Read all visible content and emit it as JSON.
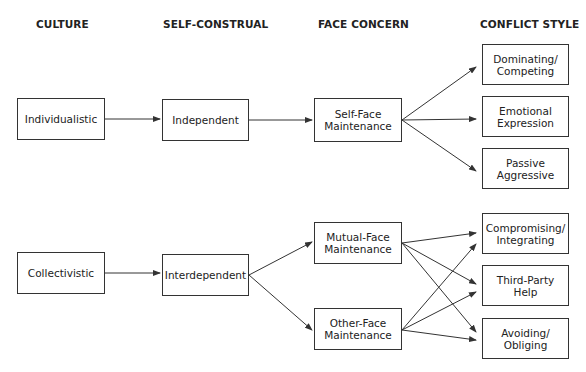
{
  "headers": {
    "culture": "CULTURE",
    "self_construal": "SELF-CONSTRUAL",
    "face_concern": "FACE CONCERN",
    "conflict_style": "CONFLICT STYLE"
  },
  "culture": {
    "individualistic": "Individualistic",
    "collectivistic": "Collectivistic"
  },
  "self_construal": {
    "independent": "Independent",
    "interdependent": "Interdependent"
  },
  "face_concern": {
    "self_face": [
      "Self-Face",
      "Maintenance"
    ],
    "mutual_face": [
      "Mutual-Face",
      "Maintenance"
    ],
    "other_face": [
      "Other-Face",
      "Maintenance"
    ]
  },
  "conflict_style": {
    "dominating": [
      "Dominating/",
      "Competing"
    ],
    "emotional": [
      "Emotional",
      "Expression"
    ],
    "passive": [
      "Passive",
      "Aggressive"
    ],
    "compromising": [
      "Compromising/",
      "Integrating"
    ],
    "third_party": [
      "Third-Party",
      "Help"
    ],
    "avoiding": [
      "Avoiding/",
      "Obliging"
    ]
  },
  "connections": [
    [
      "Individualistic",
      "Independent"
    ],
    [
      "Independent",
      "Self-Face Maintenance"
    ],
    [
      "Self-Face Maintenance",
      "Dominating/Competing"
    ],
    [
      "Self-Face Maintenance",
      "Emotional Expression"
    ],
    [
      "Self-Face Maintenance",
      "Passive Aggressive"
    ],
    [
      "Collectivistic",
      "Interdependent"
    ],
    [
      "Interdependent",
      "Mutual-Face Maintenance"
    ],
    [
      "Interdependent",
      "Other-Face Maintenance"
    ],
    [
      "Mutual-Face Maintenance",
      "Compromising/Integrating"
    ],
    [
      "Mutual-Face Maintenance",
      "Third-Party Help"
    ],
    [
      "Mutual-Face Maintenance",
      "Avoiding/Obliging"
    ],
    [
      "Other-Face Maintenance",
      "Compromising/Integrating"
    ],
    [
      "Other-Face Maintenance",
      "Third-Party Help"
    ],
    [
      "Other-Face Maintenance",
      "Avoiding/Obliging"
    ]
  ]
}
